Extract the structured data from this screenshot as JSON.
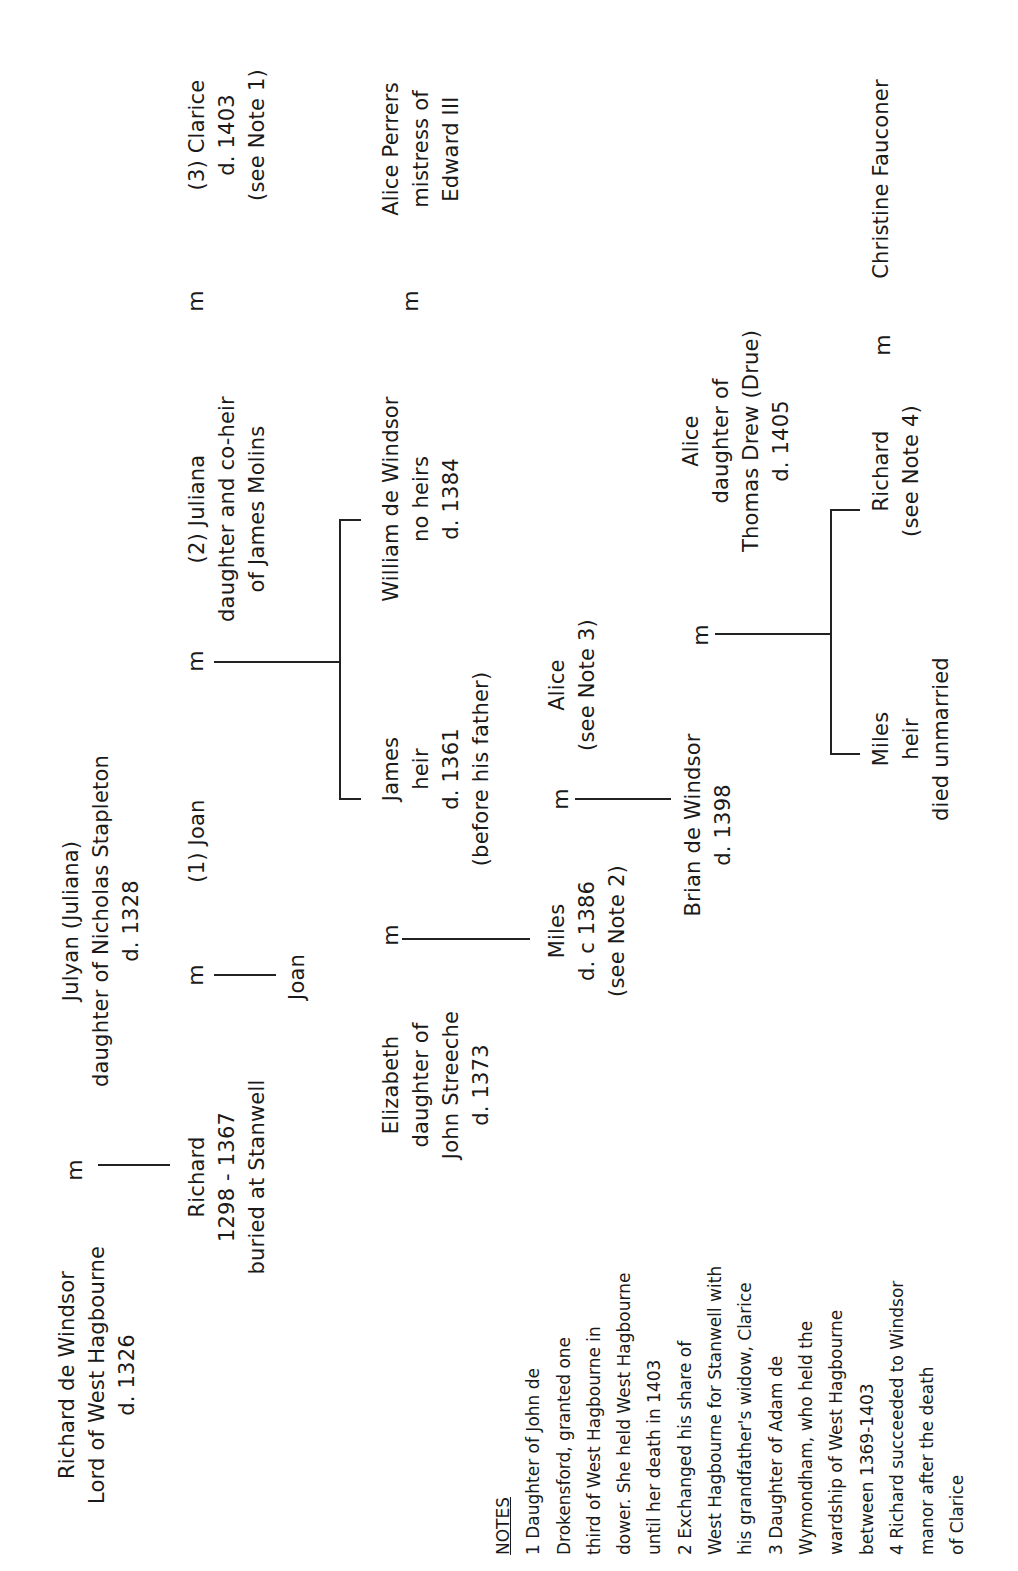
{
  "diagram": {
    "marriage_symbol": "m",
    "people": {
      "richard_sr": [
        "Richard de Windsor",
        "Lord of West Hagbourne",
        "d. 1326"
      ],
      "julyan": [
        "Julyan (Juliana)",
        "daughter of Nicholas Stapleton",
        "d. 1328"
      ],
      "richard_1298": [
        "Richard",
        "1298 - 1367",
        "buried at Stanwell"
      ],
      "joan_wife1": [
        "(1) Joan"
      ],
      "joan_child": [
        "Joan"
      ],
      "juliana_wife2": [
        "(2) Juliana",
        "daughter and co-heir",
        "of James Molins"
      ],
      "clarice_wife3": [
        "(3) Clarice",
        "d. 1403",
        "(see Note 1)"
      ],
      "elizabeth": [
        "Elizabeth",
        "daughter of",
        "John Streeche",
        "d. 1373"
      ],
      "james": [
        "James",
        "heir",
        "d. 1361",
        "(before his father)"
      ],
      "william": [
        "William de Windsor",
        "no heirs",
        "d. 1384"
      ],
      "alice_perrers": [
        "Alice Perrers",
        "mistress of",
        "Edward III"
      ],
      "miles_1386": [
        "Miles",
        "d. c 1386",
        "(see Note 2)"
      ],
      "alice_note3": [
        "Alice",
        "(see Note 3)"
      ],
      "brian": [
        "Brian de Windsor",
        "d. 1398"
      ],
      "alice_drew": [
        "Alice",
        "daughter of",
        "Thomas Drew (Drue)",
        "d. 1405"
      ],
      "miles_heir": [
        "Miles",
        "heir",
        "died unmarried"
      ],
      "richard_note4": [
        "Richard",
        "(see Note 4)"
      ],
      "christine": [
        "Christine Fauconer"
      ]
    },
    "marriages": [
      {
        "a": "Richard de Windsor",
        "b": "Julyan (Juliana)",
        "children": [
          "Richard"
        ]
      },
      {
        "a": "Richard",
        "b": "(1) Joan",
        "children": [
          "Joan"
        ]
      },
      {
        "a": "Richard",
        "b": "(2) Juliana",
        "children": [
          "James",
          "William de Windsor"
        ]
      },
      {
        "a": "Richard",
        "b": "(3) Clarice",
        "children": []
      },
      {
        "a": "William de Windsor",
        "b": "Alice Perrers",
        "children": []
      },
      {
        "a": "Elizabeth",
        "b": "James",
        "children": [
          "Miles"
        ]
      },
      {
        "a": "Miles",
        "b": "Alice",
        "children": [
          "Brian de Windsor"
        ]
      },
      {
        "a": "Brian de Windsor",
        "b": "Alice (Drew)",
        "children": [
          "Miles",
          "Richard"
        ]
      },
      {
        "a": "Richard",
        "b": "Christine Fauconer",
        "children": []
      }
    ]
  },
  "notes": {
    "title": "NOTES",
    "lines": [
      "1 Daughter of John de",
      "Drokensford, granted one",
      "third of West Hagbourne in",
      "dower. She held West Hagbourne",
      "until her death in 1403",
      "2 Exchanged his share of",
      "West Hagbourne for Stanwell with",
      "his grandfather's widow, Clarice",
      "3 Daughter of Adam de",
      "Wymondham, who held the",
      "wardship of West Hagbourne",
      "between 1369-1403",
      "4 Richard succeeded to Windsor",
      "manor after the death",
      "of Clarice"
    ]
  }
}
